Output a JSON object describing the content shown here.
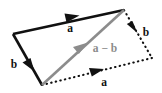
{
  "figure": {
    "type": "vector-subtraction-parallelogram-diagram",
    "background_color": "#ffffff",
    "colors": {
      "solid_vector": "#111111",
      "dashed_vector": "#111111",
      "resultant_vector": "#8c8c8c",
      "resultant_label": "#8c8c8c",
      "label": "#111111"
    },
    "labels": {
      "a_top": "a",
      "b_right": "b",
      "b_left": "b",
      "a_bottom": "a",
      "resultant": "a − b"
    },
    "vertices": {
      "left": "13,34",
      "top_right": "124,10",
      "bottom": "42,85",
      "bottom_right": "152,58"
    },
    "edges": [
      {
        "name": "a-top",
        "style": "solid",
        "from": "13,34",
        "to": "124,10",
        "label": "a"
      },
      {
        "name": "b-left",
        "style": "solid",
        "from": "13,34",
        "to": "42,85",
        "label": "b"
      },
      {
        "name": "b-right",
        "style": "dotted",
        "from": "124,10",
        "to": "152,58",
        "label": "b"
      },
      {
        "name": "a-bottom",
        "style": "dotted",
        "from": "42,85",
        "to": "152,58",
        "label": "a"
      },
      {
        "name": "a-minus-b",
        "style": "solid-gray",
        "from": "42,85",
        "to": "124,10",
        "label": "a − b"
      }
    ]
  }
}
